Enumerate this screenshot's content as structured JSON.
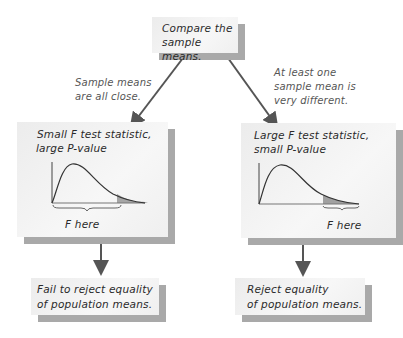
{
  "diagram": {
    "top_box": {
      "line1": "Compare the",
      "line2": "sample means."
    },
    "left_note": {
      "line1": "Sample means",
      "line2": "are all close."
    },
    "right_note": {
      "line1": "At least one",
      "line2": "sample mean is",
      "line3": "very different."
    },
    "left_box": {
      "title_line1": "Small F test statistic,",
      "title_line2": "large P-value",
      "axis_label": "F here",
      "shaded_tail": "right tail (small)",
      "bracket_position": "middle/left region of curve"
    },
    "right_box": {
      "title_line1": "Large F test statistic,",
      "title_line2": "small P-value",
      "axis_label": "F here",
      "shaded_tail": "right tail (small)",
      "bracket_position": "far right tail"
    },
    "left_result": {
      "line1": "Fail to reject equality",
      "line2": "of population means."
    },
    "right_result": {
      "line1": "Reject equality",
      "line2": "of population means."
    },
    "colors": {
      "box_fill": "#f1f1f1",
      "box_shadow": "#a9a9a9",
      "arrow": "#555555",
      "curve": "#333333",
      "tail_shade": "#9a9a9a"
    }
  }
}
